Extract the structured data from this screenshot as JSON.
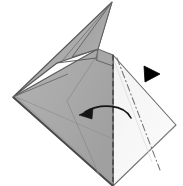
{
  "figure": {
    "kind": "origami-fold-diagram",
    "background_color": "#ffffff",
    "width": 183,
    "height": 186
  },
  "palette": {
    "paper_shaded": "#a9a9a9",
    "paper_shaded_mid": "#b4b4b4",
    "paper_shaded_dark": "#9b9b9b",
    "paper_white": "#f6f6f6",
    "paper_white_tint": "#efefef",
    "outline": "#555555",
    "outline_dark": "#3a3a3a",
    "crease_line": "#707070",
    "fold_dashed": "#4a4a4a",
    "arrow_color": "#111111",
    "marker_black": "#000000"
  },
  "shapes": {
    "left_shaded_panel": {
      "name": "left-shaded-paper-panel",
      "fill": "#a9a9a9",
      "points": "13,97 96,50 113,186 13,97"
    },
    "right_white_panel": {
      "name": "right-white-paper-panel",
      "fill": "#f6f6f6",
      "points": "113,55 176,125 113,186"
    },
    "upper_spike": {
      "name": "upper-spike-flap",
      "fill": "#b2b2b2",
      "points": "112,2 13,97 56,64 97,49"
    },
    "spike_inner_fold": {
      "name": "spike-inner-fold-face",
      "fill": "#9f9f9f",
      "points": "112,2 97,49 70,56"
    },
    "upper_right_flap": {
      "name": "upper-right-flap",
      "fill": "#ababab",
      "points": "97,49 113,55 113,64 96,59"
    },
    "center_band": {
      "name": "center-vertical-band",
      "fill": "#ededed"
    }
  },
  "lines": {
    "vertical_fold": {
      "name": "vertical-dashed-fold-line",
      "style": "dashed",
      "from": [
        113,
        55
      ],
      "to": [
        113,
        186
      ],
      "color": "#4a4a4a"
    },
    "diagonal_dashdot_fold": {
      "name": "diagonal-dash-dot-fold-line",
      "style": "dash-dot",
      "from": [
        117,
        58
      ],
      "to": [
        160,
        170
      ],
      "color": "#777777"
    },
    "inner_crease_left": {
      "name": "left-panel-crease",
      "style": "solid-thin",
      "from": [
        66,
        103
      ],
      "to": [
        96,
        171
      ],
      "color": "#8a8a8a"
    },
    "inner_crease_diag": {
      "name": "left-panel-diagonal-crease",
      "style": "solid-thin",
      "from": [
        13,
        97
      ],
      "to": [
        113,
        140
      ],
      "color": "#8f8f8f"
    },
    "faint_right_crease": {
      "name": "right-panel-faint-crease",
      "style": "solid-faint",
      "from": [
        113,
        58
      ],
      "to": [
        150,
        160
      ],
      "color": "#d6d6d6"
    }
  },
  "annotations": {
    "fold_arrow": {
      "name": "fold-direction-arrow",
      "description": "curved arrow pointing left",
      "direction": "left",
      "color": "#111111",
      "path": "M 131,118 C 124,104 100,103 85,112",
      "head_points": "79,115 93,108 92,119"
    },
    "black_triangle_marker": {
      "name": "black-triangle-marker",
      "description": "solid black right-pointing triangle",
      "direction": "right",
      "color": "#000000",
      "points": "144,66 160,74 145,82"
    }
  },
  "labels": {
    "step_number": "",
    "caption": ""
  }
}
